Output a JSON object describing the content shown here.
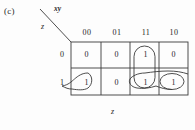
{
  "figure": {
    "label": "(c)",
    "type": "karnaugh-map",
    "axis_top_label": "xy",
    "axis_left_label": "z",
    "axis_bottom_label": "z"
  },
  "kmap": {
    "column_headers": [
      "00",
      "01",
      "11",
      "10"
    ],
    "row_headers": [
      "0",
      "1"
    ],
    "rows": [
      {
        "header": "0",
        "cells": [
          "0",
          "0",
          "1",
          "0"
        ]
      },
      {
        "header": "1",
        "cells": [
          "1",
          "0",
          "1",
          "1"
        ]
      }
    ],
    "groupings": [
      {
        "name": "vertical-group-column-11",
        "cells": [
          "r0c11",
          "r1c11"
        ],
        "shape": "vertical-oval"
      },
      {
        "name": "wraparound-group-row-1",
        "cells": [
          "r1c10",
          "r1c00"
        ],
        "shape": "horizontal-wrap-oval"
      },
      {
        "name": "wraparound-group-row-1-right",
        "cells": [
          "r1c11",
          "r1c10"
        ],
        "shape": "horizontal-oval"
      }
    ]
  },
  "style": {
    "ink": "#2b2b2b",
    "grid": "#3a3a3a",
    "background": "#fdfdfd"
  }
}
